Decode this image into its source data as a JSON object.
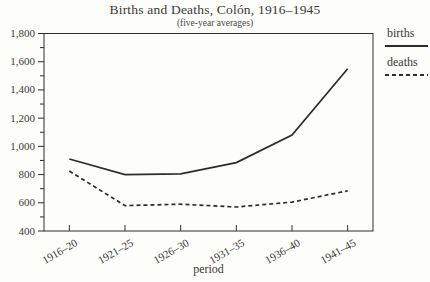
{
  "chart_data": {
    "type": "line",
    "title": "Births and Deaths, Colón, 1916–1945",
    "subtitle": "(five-year averages)",
    "xlabel": "period",
    "categories": [
      "1916–20",
      "1921–25",
      "1926–30",
      "1931–35",
      "1936–40",
      "1941–45"
    ],
    "series": [
      {
        "name": "births",
        "line_style": "solid",
        "values": [
          910,
          800,
          805,
          885,
          1080,
          1550
        ]
      },
      {
        "name": "deaths",
        "line_style": "dashed",
        "values": [
          825,
          580,
          590,
          570,
          605,
          685
        ]
      }
    ],
    "ylim": [
      400,
      1800
    ],
    "ytick_major": 200,
    "ytick_minor": 100,
    "ytick_labels": [
      "400",
      "600",
      "800",
      "1,000",
      "1,200",
      "1,400",
      "1,600",
      "1,800"
    ],
    "grid": false,
    "legend_position": "right-top",
    "line_color": "#2e2c29",
    "text_color": "#3b3833"
  }
}
